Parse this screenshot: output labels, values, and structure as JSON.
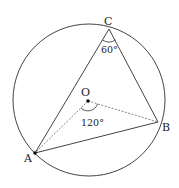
{
  "diagram": {
    "title": "",
    "points": [
      {
        "id": "A",
        "label": "A"
      },
      {
        "id": "B",
        "label": "B"
      },
      {
        "id": "C",
        "label": "C"
      },
      {
        "id": "O",
        "label": "O"
      }
    ],
    "angles": {
      "inscribed_C": "60°",
      "central_AOB": "120°"
    },
    "colors": {
      "stroke": "#444444",
      "dashed": "#666666",
      "text": "#222222",
      "background": "#ffffff"
    }
  }
}
